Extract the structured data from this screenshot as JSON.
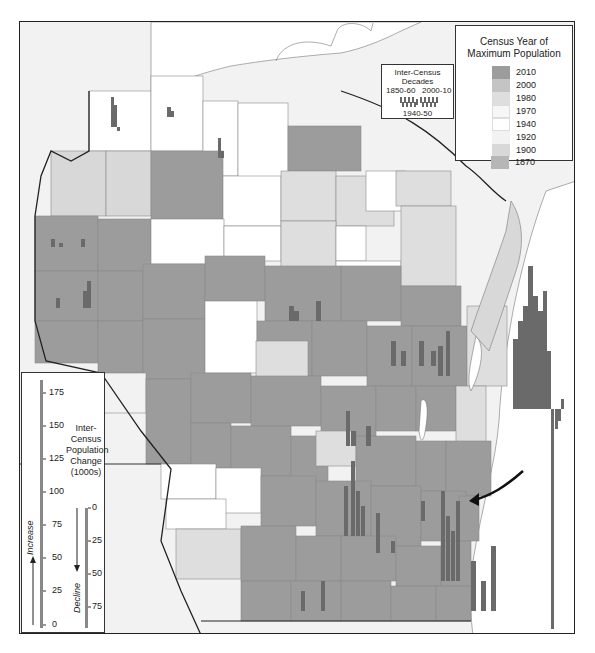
{
  "map": {
    "region": "Wisconsin counties",
    "colors": {
      "y2010": "#9a9a9a",
      "y2000": "#b8b8b8",
      "y1980": "#d4d4d4",
      "y1970": "#ededed",
      "y1940": "#ffffff",
      "y1920": "#f4f4f4",
      "y1900": "#dcdcdc",
      "y1870": "#bdbdbd",
      "bars": "#6a6a6a",
      "water": "#ffffff",
      "outside": "#f2f2f2"
    }
  },
  "legend_year": {
    "title_line1": "Census Year of",
    "title_line2": "Maximum Population",
    "items": [
      {
        "label": "2010",
        "color": "#9c9c9c"
      },
      {
        "label": "2000",
        "color": "#c4c4c4"
      },
      {
        "label": "1980",
        "color": "#dedede"
      },
      {
        "label": "1970",
        "color": "#f6f6f6"
      },
      {
        "label": "1940",
        "color": "#ffffff"
      },
      {
        "label": "1920",
        "color": "#f2f2f2"
      },
      {
        "label": "1900",
        "color": "#d8d8d8"
      },
      {
        "label": "1870",
        "color": "#b6b6b6"
      }
    ]
  },
  "legend_decades": {
    "title": "Inter-Census Decades",
    "left_label": "1850-60",
    "right_label": "2000-10",
    "bottom_label": "1940-50"
  },
  "legend_scale": {
    "title_lines": [
      "Inter-",
      "Census",
      "Population",
      "Change",
      "(1000s)"
    ],
    "increase_label": "Increase",
    "decline_label": "Decline",
    "increase_ticks": [
      "175",
      "150",
      "125",
      "100",
      "75",
      "50",
      "25",
      "0"
    ],
    "decline_ticks": [
      "0",
      "25",
      "50",
      "75"
    ]
  }
}
